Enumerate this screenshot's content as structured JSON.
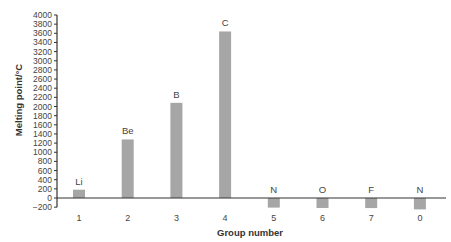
{
  "chart_data": {
    "type": "bar",
    "title": "",
    "xlabel": "Group number",
    "ylabel": "Melting point/°C",
    "categories": [
      "1",
      "2",
      "3",
      "4",
      "5",
      "6",
      "7",
      "0"
    ],
    "bar_labels": [
      "Li",
      "Be",
      "B",
      "C",
      "N",
      "O",
      "F",
      "N"
    ],
    "values": [
      181,
      1280,
      2080,
      3640,
      -210,
      -218,
      -220,
      -249
    ],
    "ylim": [
      -200,
      4000
    ],
    "yticks": [
      -200,
      0,
      200,
      400,
      600,
      800,
      1000,
      1200,
      1400,
      1600,
      1800,
      2000,
      2200,
      2400,
      2600,
      2800,
      3000,
      3200,
      3400,
      3600,
      3800,
      4000
    ],
    "ytick_labels": [
      "−200",
      "0",
      "200",
      "400",
      "600",
      "800",
      "1000",
      "1200",
      "1400",
      "1600",
      "1800",
      "2000",
      "2200",
      "2400",
      "2600",
      "2800",
      "3000",
      "3200",
      "3400",
      "3600",
      "3800",
      "4000"
    ],
    "grid": false,
    "legend": "none",
    "bar_color": "#a6a6a6"
  }
}
